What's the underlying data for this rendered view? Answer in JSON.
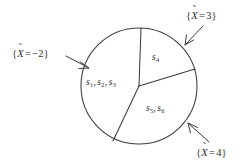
{
  "figure": {
    "type": "partition-diagram",
    "background_color": "#ffffff",
    "stroke_color": "#3b3b3f",
    "text_color": "#2e2e32",
    "circle": {
      "cx": 139,
      "cy": 86,
      "r": 58
    },
    "regions": [
      {
        "id": "region-left",
        "label_text": "s1, s2, s3",
        "outcomes": [
          "s1",
          "s2",
          "s3"
        ],
        "label_x": 86,
        "label_y": 78
      },
      {
        "id": "region-top",
        "label_text": "s4",
        "outcomes": [
          "s4"
        ],
        "label_x": 152,
        "label_y": 53
      },
      {
        "id": "region-bottom",
        "label_text": "s5, s6",
        "outcomes": [
          "s5",
          "s6"
        ],
        "label_x": 146,
        "label_y": 104
      }
    ],
    "callouts": [
      {
        "id": "callout-left",
        "variable": "X",
        "accent": "tilde",
        "relation": "=",
        "value": "-2",
        "text": "{X = -2}",
        "label_x": 12,
        "label_y": 49,
        "leader": {
          "x1": 66,
          "y1": 56,
          "x2": 89,
          "y2": 68
        }
      },
      {
        "id": "callout-top-right",
        "variable": "X",
        "accent": "tilde",
        "relation": "=",
        "value": "3",
        "text": "{X = 3}",
        "label_x": 186,
        "label_y": 11,
        "leader": {
          "x1": 203,
          "y1": 26,
          "x2": 185,
          "y2": 45
        }
      },
      {
        "id": "callout-bottom-right",
        "variable": "X",
        "accent": "tilde",
        "relation": "=",
        "value": "4",
        "text": "{X = 4}",
        "label_x": 196,
        "label_y": 148,
        "leader": {
          "x1": 209,
          "y1": 142,
          "x2": 188,
          "y2": 123
        }
      }
    ],
    "dividers": [
      {
        "id": "divider-top",
        "x1": 139,
        "y1": 86,
        "x2": 141,
        "y2": 28
      },
      {
        "id": "divider-right",
        "x1": 139,
        "y1": 86,
        "x2": 195,
        "y2": 69
      },
      {
        "id": "divider-lower-left",
        "x1": 139,
        "y1": 86,
        "x2": 113,
        "y2": 141
      }
    ]
  }
}
